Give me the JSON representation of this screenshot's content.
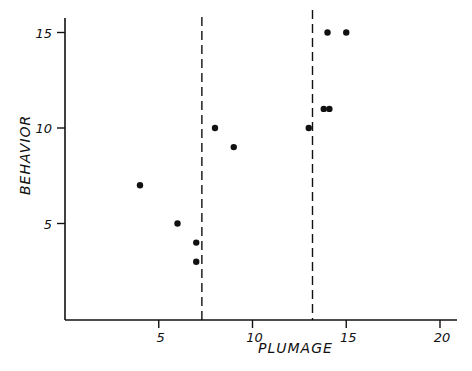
{
  "chart_data": {
    "type": "scatter",
    "title": "",
    "xlabel": "PLUMAGE",
    "ylabel": "BEHAVIOR",
    "xlim": [
      0,
      21
    ],
    "ylim": [
      0,
      15.5
    ],
    "xticks": [
      5,
      10,
      15,
      20
    ],
    "yticks": [
      5,
      10,
      15
    ],
    "grid": false,
    "legend": null,
    "points": [
      {
        "x": 4,
        "y": 7
      },
      {
        "x": 6,
        "y": 5
      },
      {
        "x": 7,
        "y": 4
      },
      {
        "x": 7,
        "y": 3
      },
      {
        "x": 8,
        "y": 10
      },
      {
        "x": 9,
        "y": 9
      },
      {
        "x": 13,
        "y": 10
      },
      {
        "x": 13.8,
        "y": 11
      },
      {
        "x": 14.1,
        "y": 11
      },
      {
        "x": 14,
        "y": 15
      },
      {
        "x": 15,
        "y": 15
      }
    ],
    "reference_lines": [
      {
        "orientation": "vertical",
        "x": 7.3,
        "style": "dashed"
      },
      {
        "orientation": "vertical",
        "x": 13.2,
        "style": "dashed"
      }
    ],
    "colors": {
      "ink": "#111111",
      "background": "#ffffff"
    }
  },
  "axes": {
    "x_label": "PLUMAGE",
    "y_label": "BEHAVIOR",
    "x_tick_labels": [
      "5",
      "10",
      "15",
      "20"
    ],
    "y_tick_labels": [
      "5",
      "10",
      "15"
    ]
  }
}
